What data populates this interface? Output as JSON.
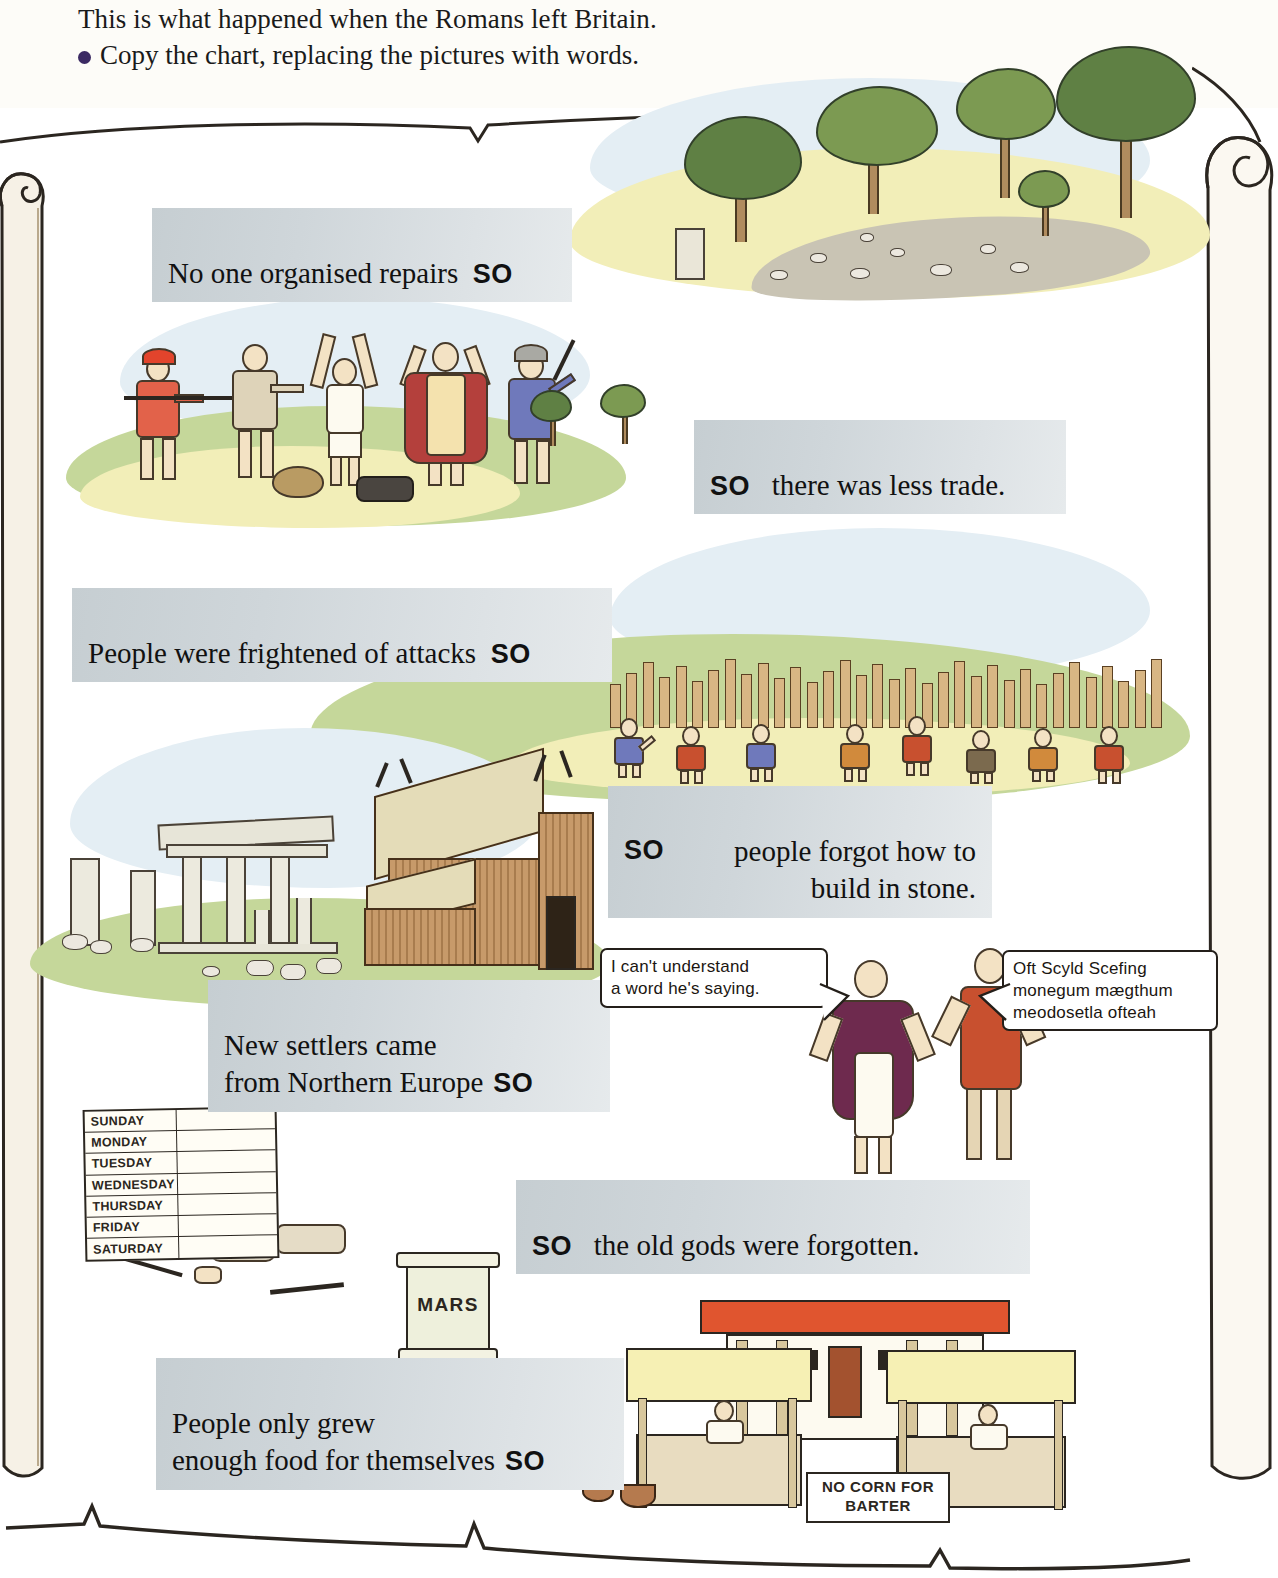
{
  "header": {
    "intro": "This is what happened when the Romans left Britain.",
    "task": "Copy the chart, replacing the pictures with words.",
    "bullet_color": "#3b2a63"
  },
  "chart_data": {
    "type": "table",
    "title": "What happened when the Romans left Britain",
    "connector": "SO",
    "steps": [
      {
        "index": 1,
        "text": "No one organised repairs",
        "connector_position": "after",
        "picture": "overgrown-roman-road-with-trees"
      },
      {
        "index": 2,
        "text": "there was less trade.",
        "connector_position": "before",
        "picture": "bandits-robbing-travellers-on-road"
      },
      {
        "index": 3,
        "text": "People were frightened of attacks",
        "connector_position": "after",
        "picture": "villagers-building-wooden-palisade-fort"
      },
      {
        "index": 4,
        "text": "people forgot how to\nbuild in stone.",
        "connector_position": "before",
        "picture": "roman-ruins-beside-wooden-saxon-hall"
      },
      {
        "index": 5,
        "text": "New settlers came\nfrom Northern Europe",
        "connector_position": "after",
        "picture": "roman-and-saxon-unable-to-understand-each-other"
      },
      {
        "index": 6,
        "text": "the old gods were forgotten.",
        "connector_position": "before",
        "picture": "days-of-week-chart-fallen-roman-soldier-mars-altar"
      },
      {
        "index": 7,
        "text": "People only grew\nenough food for themselves",
        "connector_position": "after",
        "picture": "empty-roman-market-villa-no-corn-for-barter"
      }
    ],
    "caption_bg": "#ced5d9"
  },
  "scenes": {
    "settlers": {
      "roman_speech": "I can't understand\na word he's saying.",
      "saxon_speech": "Oft Scyld Scefing\nmonegum mægthum\nmeodosetla ofteah"
    },
    "gods": {
      "days_chart_title": "days-of-the-week-chart",
      "days": [
        "SUNDAY",
        "MONDAY",
        "TUESDAY",
        "WEDNESDAY",
        "THURSDAY",
        "FRIDAY",
        "SATURDAY"
      ],
      "altar_label": "MARS"
    },
    "market": {
      "sign_text": "NO CORN FOR\nBARTER"
    }
  },
  "captions": {
    "c1_text": "No one organised repairs",
    "c1_so": "SO",
    "c2_so": "SO",
    "c2_text": "there was less trade.",
    "c3_text": "People were frightened of attacks",
    "c3_so": "SO",
    "c4_so": "SO",
    "c4_text": "people forgot how to\nbuild in stone.",
    "c5_text": "New settlers came\nfrom Northern Europe",
    "c5_so": "SO",
    "c6_so": "SO",
    "c6_text": "the old gods were forgotten.",
    "c7_text": "People only grew\nenough food for themselves",
    "c7_so": "SO"
  }
}
